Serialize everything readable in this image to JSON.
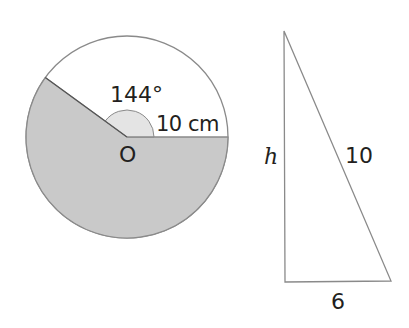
{
  "circle": {
    "angle_label": "144°",
    "radius_label": "10 cm",
    "center_label": "O",
    "angle_degrees": 144,
    "shaded_color": "#c8c8c8",
    "angle_marker_color": "#e6e6e6",
    "stroke_color": "#8a8a8a"
  },
  "triangle": {
    "height_label": "h",
    "hypotenuse_label": "10",
    "base_label": "6",
    "stroke_color": "#8a8a8a"
  }
}
